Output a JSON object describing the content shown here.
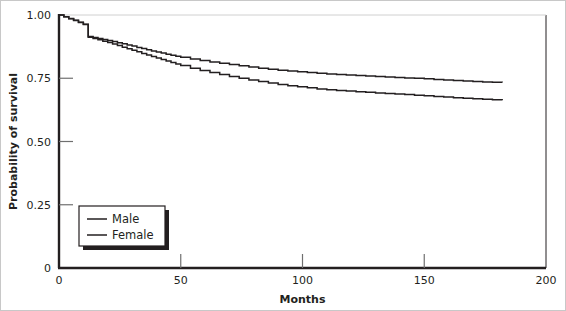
{
  "chart_data": {
    "type": "line",
    "title": "",
    "subtitle": "",
    "xlabel": "Months",
    "ylabel": "Probability of survival",
    "xlim": [
      0,
      200
    ],
    "ylim": [
      0,
      1.0
    ],
    "xticks": [
      0,
      50,
      100,
      150,
      200
    ],
    "xtick_labels": [
      "0",
      "50",
      "100",
      "150",
      "200"
    ],
    "yticks": [
      0,
      0.25,
      0.5,
      0.75,
      1.0
    ],
    "ytick_labels": [
      "0",
      "0.25",
      "0.50",
      "0.75",
      "1.00"
    ],
    "grid": false,
    "legend_position": "lower-left",
    "line_color": "#231f20",
    "axis_color": "#231f20",
    "step_style": "post",
    "legend": [
      "Male",
      "Female"
    ],
    "series": [
      {
        "name": "Male",
        "color": "#231f20",
        "x": [
          0,
          2,
          4,
          6,
          8,
          10,
          12,
          12,
          14,
          16,
          18,
          20,
          22,
          24,
          26,
          28,
          30,
          32,
          34,
          36,
          38,
          40,
          42,
          44,
          46,
          48,
          50,
          54,
          58,
          62,
          66,
          70,
          74,
          78,
          82,
          86,
          90,
          94,
          98,
          102,
          106,
          110,
          114,
          118,
          122,
          126,
          130,
          134,
          138,
          142,
          146,
          150,
          154,
          158,
          162,
          166,
          170,
          174,
          178,
          182
        ],
        "y": [
          1.0,
          0.993,
          0.986,
          0.979,
          0.971,
          0.963,
          0.956,
          0.915,
          0.911,
          0.907,
          0.903,
          0.899,
          0.895,
          0.89,
          0.886,
          0.881,
          0.877,
          0.872,
          0.868,
          0.863,
          0.858,
          0.854,
          0.85,
          0.845,
          0.841,
          0.837,
          0.833,
          0.826,
          0.82,
          0.814,
          0.809,
          0.804,
          0.799,
          0.794,
          0.79,
          0.786,
          0.782,
          0.779,
          0.776,
          0.773,
          0.77,
          0.767,
          0.765,
          0.763,
          0.761,
          0.759,
          0.757,
          0.755,
          0.753,
          0.751,
          0.75,
          0.748,
          0.745,
          0.743,
          0.741,
          0.739,
          0.737,
          0.735,
          0.734,
          0.733
        ]
      },
      {
        "name": "Female",
        "color": "#231f20",
        "x": [
          0,
          2,
          4,
          6,
          8,
          10,
          12,
          12,
          14,
          16,
          18,
          20,
          22,
          24,
          26,
          28,
          30,
          32,
          34,
          36,
          38,
          40,
          42,
          44,
          46,
          48,
          50,
          54,
          58,
          62,
          66,
          70,
          74,
          78,
          82,
          86,
          90,
          94,
          98,
          102,
          106,
          110,
          114,
          118,
          122,
          126,
          130,
          134,
          138,
          142,
          146,
          150,
          154,
          158,
          162,
          166,
          170,
          174,
          178,
          182
        ],
        "y": [
          1.0,
          0.993,
          0.985,
          0.978,
          0.97,
          0.962,
          0.954,
          0.912,
          0.907,
          0.902,
          0.896,
          0.891,
          0.885,
          0.879,
          0.873,
          0.867,
          0.861,
          0.855,
          0.848,
          0.842,
          0.836,
          0.83,
          0.824,
          0.818,
          0.812,
          0.806,
          0.8,
          0.79,
          0.781,
          0.773,
          0.765,
          0.757,
          0.75,
          0.743,
          0.737,
          0.731,
          0.725,
          0.72,
          0.716,
          0.712,
          0.708,
          0.705,
          0.702,
          0.7,
          0.697,
          0.695,
          0.692,
          0.69,
          0.688,
          0.686,
          0.683,
          0.681,
          0.678,
          0.676,
          0.673,
          0.671,
          0.669,
          0.667,
          0.665,
          0.663
        ]
      }
    ]
  }
}
